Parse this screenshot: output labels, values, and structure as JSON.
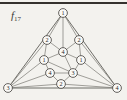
{
  "figure": {
    "label": "f",
    "subscript": "17",
    "colors": {
      "background": "#f3f2ee",
      "rule": "#35322e",
      "edge": "#7a7873",
      "outer_edge": "#5f5d58",
      "vertex_fill": "#faf9f6",
      "vertex_stroke": "#413f3b",
      "vertex_text": "#2b2a27"
    },
    "graph": {
      "vertex_radius": 4.4,
      "vertices": [
        {
          "id": "outer-top",
          "label": "1",
          "x": 63,
          "y": 13
        },
        {
          "id": "outer-left",
          "label": "3",
          "x": 8,
          "y": 88
        },
        {
          "id": "outer-right",
          "label": "4",
          "x": 117,
          "y": 88
        },
        {
          "id": "inner-upper-left",
          "label": "2",
          "x": 47,
          "y": 40
        },
        {
          "id": "inner-upper-right",
          "label": "2",
          "x": 79,
          "y": 40
        },
        {
          "id": "center",
          "label": "4",
          "x": 63,
          "y": 52
        },
        {
          "id": "inner-mid-left",
          "label": "1",
          "x": 44,
          "y": 60
        },
        {
          "id": "inner-mid-right",
          "label": "1",
          "x": 81,
          "y": 60
        },
        {
          "id": "inner-lower-left",
          "label": "4",
          "x": 50,
          "y": 73
        },
        {
          "id": "inner-lower-right",
          "label": "3",
          "x": 73,
          "y": 73
        },
        {
          "id": "inner-bottom",
          "label": "2",
          "x": 61,
          "y": 84
        }
      ],
      "outer_edges": [
        [
          "outer-top",
          "outer-left"
        ],
        [
          "outer-top",
          "outer-right"
        ],
        [
          "outer-left",
          "outer-right"
        ]
      ],
      "edges": [
        [
          "outer-top",
          "inner-upper-left"
        ],
        [
          "outer-top",
          "center"
        ],
        [
          "outer-top",
          "inner-upper-right"
        ],
        [
          "outer-left",
          "inner-upper-left"
        ],
        [
          "outer-left",
          "inner-mid-left"
        ],
        [
          "outer-left",
          "inner-lower-left"
        ],
        [
          "outer-left",
          "inner-bottom"
        ],
        [
          "outer-right",
          "inner-upper-right"
        ],
        [
          "outer-right",
          "inner-mid-right"
        ],
        [
          "outer-right",
          "inner-lower-right"
        ],
        [
          "outer-right",
          "inner-bottom"
        ],
        [
          "inner-upper-left",
          "inner-mid-left"
        ],
        [
          "inner-mid-left",
          "inner-lower-left"
        ],
        [
          "inner-lower-left",
          "inner-bottom"
        ],
        [
          "inner-bottom",
          "inner-lower-right"
        ],
        [
          "inner-lower-right",
          "inner-mid-right"
        ],
        [
          "inner-mid-right",
          "inner-upper-right"
        ],
        [
          "inner-upper-left",
          "center"
        ],
        [
          "center",
          "inner-upper-right"
        ],
        [
          "center",
          "inner-mid-left"
        ],
        [
          "center",
          "inner-mid-right"
        ],
        [
          "center",
          "inner-lower-right"
        ],
        [
          "inner-mid-left",
          "inner-lower-right"
        ],
        [
          "inner-lower-left",
          "inner-lower-right"
        ]
      ]
    }
  }
}
